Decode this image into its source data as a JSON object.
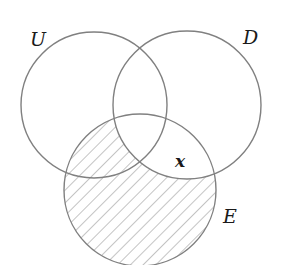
{
  "diagram": {
    "type": "venn",
    "sets": [
      {
        "id": "U",
        "label": "U",
        "cx": 94,
        "cy": 105,
        "r": 73,
        "label_x": 30,
        "label_y": 46
      },
      {
        "id": "D",
        "label": "D",
        "cx": 187,
        "cy": 105,
        "r": 74,
        "label_x": 243,
        "label_y": 44
      },
      {
        "id": "E",
        "label": "E",
        "cx": 140,
        "cy": 190,
        "r": 76,
        "label_x": 223,
        "label_y": 223
      }
    ],
    "region_label": {
      "text": "x",
      "x": 176,
      "y": 168,
      "region": "D ∩ E outside U"
    },
    "shaded_region": "E minus D (hatched)",
    "colors": {
      "stroke": "#808080",
      "hatch": "#8a8a8a",
      "text": "#1a1a1a",
      "background": "#ffffff"
    }
  }
}
